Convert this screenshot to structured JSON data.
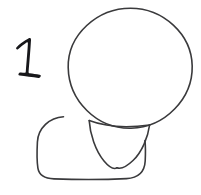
{
  "figure": {
    "title": "Hand-drawn figure sketch",
    "kind": "line-drawing",
    "background_color": "#ffffff",
    "ink_color": "#3a3a3c",
    "label_color": "#17171a",
    "stroke_width": 1.6,
    "canvas": {
      "width": 201,
      "height": 195
    }
  },
  "label": {
    "text": "1",
    "position": {
      "x": 15,
      "y": 38,
      "width": 30,
      "height": 42
    },
    "style": "hand-drawn numeral with angled top flag and flat base serif"
  },
  "shapes": [
    {
      "name": "head-circle",
      "role": "head",
      "type": "ellipse",
      "center": {
        "x": 130,
        "y": 68
      },
      "radius": {
        "rx": 62,
        "ry": 60
      }
    },
    {
      "name": "body-rounded-rect",
      "role": "torso",
      "type": "rounded-rectangle",
      "bounds": {
        "x": 37,
        "y": 116,
        "width": 108,
        "height": 63
      },
      "corner_radius": 26
    },
    {
      "name": "collar-v-shape",
      "role": "neck-collar",
      "type": "v-curve",
      "bounds": {
        "x": 88,
        "y": 120,
        "width": 62,
        "height": 50
      },
      "apex": {
        "x": 116,
        "y": 168
      }
    }
  ]
}
